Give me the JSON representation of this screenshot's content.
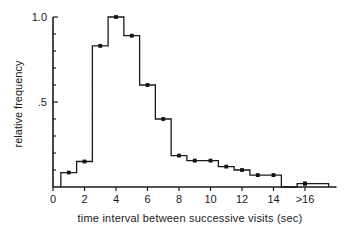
{
  "figure": {
    "background_color": "#ffffff",
    "line_color": "#1a1a1a",
    "marker_color": "#111111"
  },
  "axes": {
    "y_title": "relative frequency",
    "x_title": "time interval  between  successive  visits  (sec)",
    "y_tick_labels": [
      "1.0",
      ".5"
    ],
    "x_tick_labels": [
      "0",
      "2",
      "4",
      "6",
      "8",
      "10",
      "12",
      "14",
      ">16"
    ]
  },
  "chart_data": {
    "type": "bar",
    "title": "",
    "subtitle": "",
    "xlabel": "time interval  between  successive  visits  (sec)",
    "ylabel": "relative frequency",
    "xlim": [
      -0.6,
      18.0
    ],
    "ylim": [
      0,
      1.05
    ],
    "grid": false,
    "legend": null,
    "x_ticks": [
      0,
      2,
      4,
      6,
      8,
      10,
      12,
      14,
      16
    ],
    "x_tick_labels": [
      "0",
      "2",
      "4",
      "6",
      "8",
      "10",
      "12",
      "14",
      ">16"
    ],
    "y_ticks": [
      0.5,
      1.0
    ],
    "y_tick_labels": [
      ".5",
      "1.0"
    ],
    "y_minor_ticks": [
      0.1,
      0.2,
      0.3,
      0.4,
      0.6,
      0.7,
      0.8,
      0.9
    ],
    "bin_width": 1,
    "bin_left_edges": [
      0.5,
      1.5,
      2.5,
      3.5,
      4.5,
      5.5,
      6.5,
      7.5,
      8.5,
      9.5,
      10.5,
      11.5,
      12.5,
      13.5,
      14.5,
      15.5,
      16.5
    ],
    "categories": [
      "1",
      "2",
      "3",
      "4",
      "5",
      "6",
      "7",
      "8",
      "9",
      "10",
      "11",
      "12",
      "13",
      "14",
      "15",
      "16",
      ">16"
    ],
    "values": [
      0.085,
      0.15,
      0.83,
      1.0,
      0.89,
      0.6,
      0.4,
      0.185,
      0.155,
      0.155,
      0.12,
      0.1,
      0.07,
      0.07,
      0.0,
      0.02,
      0.02
    ],
    "marker_points": [
      {
        "x": 1,
        "y": 0.085
      },
      {
        "x": 2,
        "y": 0.15
      },
      {
        "x": 3,
        "y": 0.83
      },
      {
        "x": 4,
        "y": 1.0
      },
      {
        "x": 5,
        "y": 0.89
      },
      {
        "x": 6,
        "y": 0.6
      },
      {
        "x": 7,
        "y": 0.4
      },
      {
        "x": 8,
        "y": 0.185
      },
      {
        "x": 9,
        "y": 0.155
      },
      {
        "x": 10,
        "y": 0.155
      },
      {
        "x": 11,
        "y": 0.12
      },
      {
        "x": 12,
        "y": 0.1
      },
      {
        "x": 13,
        "y": 0.07
      },
      {
        "x": 14,
        "y": 0.07
      },
      {
        "x": 16,
        "y": 0.02
      }
    ]
  }
}
